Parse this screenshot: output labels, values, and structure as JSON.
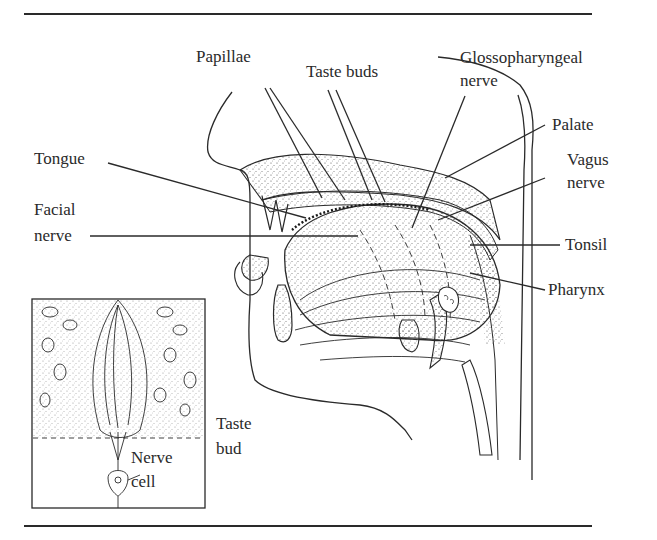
{
  "diagram": {
    "labels": {
      "papillae": "Papillae",
      "taste_buds": "Taste buds",
      "glossopharyngeal_1": "Glossopharyngeal",
      "glossopharyngeal_2": "nerve",
      "palate": "Palate",
      "vagus_1": "Vagus",
      "vagus_2": "nerve",
      "tongue": "Tongue",
      "facial_1": "Facial",
      "facial_2": "nerve",
      "tonsil": "Tonsil",
      "pharynx": "Pharynx",
      "taste_bud_1": "Taste",
      "taste_bud_2": "bud",
      "nerve_cell_1": "Nerve",
      "nerve_cell_2": "cell"
    },
    "colors": {
      "ink": "#2a2a2a",
      "background": "#ffffff",
      "stipple": "#555555"
    }
  }
}
